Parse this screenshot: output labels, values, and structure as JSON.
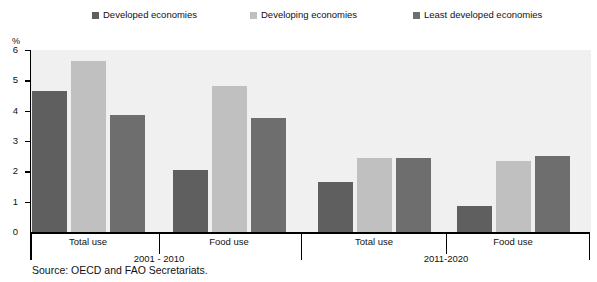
{
  "axis_unit": "%",
  "source_note": "Source:  OECD and FAO Secretariats.",
  "legend": [
    {
      "label": "Developed economies",
      "color": "#5f5f5f",
      "icon": "square-swatch-icon"
    },
    {
      "label": "Developing economies",
      "color": "#c0c0c0",
      "icon": "square-swatch-icon"
    },
    {
      "label": "Least developed economies",
      "color": "#6e6e6e",
      "icon": "square-swatch-icon"
    }
  ],
  "chart_data": {
    "type": "bar",
    "title": "",
    "subtitle": "",
    "xlabel": "",
    "ylabel": "%",
    "ylim": [
      0,
      6
    ],
    "yticks": [
      0,
      1,
      2,
      3,
      4,
      5,
      6
    ],
    "grid": false,
    "legend_position": "top",
    "panels": [
      "2001 - 2010",
      "2011-2020"
    ],
    "categories": [
      "Total use",
      "Food use",
      "Total use",
      "Food use"
    ],
    "category_panels": [
      "2001 - 2010",
      "2001 - 2010",
      "2011-2020",
      "2011-2020"
    ],
    "series": [
      {
        "name": "Developed economies",
        "color": "#5f5f5f",
        "values": [
          4.65,
          2.05,
          1.65,
          0.85
        ]
      },
      {
        "name": "Developing economies",
        "color": "#c0c0c0",
        "values": [
          5.65,
          4.8,
          2.45,
          2.35
        ]
      },
      {
        "name": "Least developed economies",
        "color": "#6e6e6e",
        "values": [
          3.85,
          3.75,
          2.45,
          2.5
        ]
      }
    ],
    "plot_background": "#f0f0f0",
    "axis_color": "#000000"
  }
}
